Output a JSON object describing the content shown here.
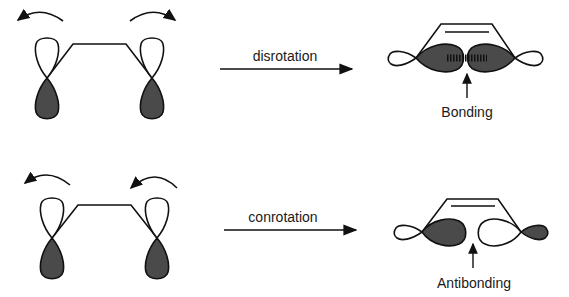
{
  "diagram": {
    "rows": [
      {
        "mode_label": "disrotation",
        "rotation_arrows": "left-counterclockwise, right-clockwise",
        "result_label": "Bonding"
      },
      {
        "mode_label": "conrotation",
        "rotation_arrows": "both-counterclockwise",
        "result_label": "Antibonding"
      }
    ],
    "colors": {
      "shaded_lobe": "#4a4a4a",
      "line": "#111111",
      "background": "#ffffff"
    }
  }
}
